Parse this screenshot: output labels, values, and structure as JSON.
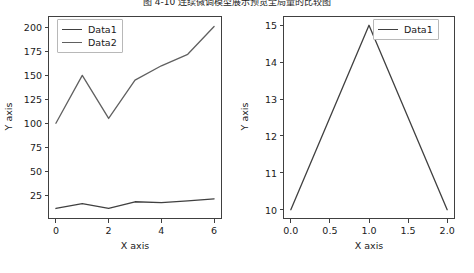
{
  "figure": {
    "title": "图 4-10  连续微调模型展示预览全局量的比较图",
    "background": "#ffffff",
    "line_color": "#404040",
    "frame_color": "#404040"
  },
  "chart_data": [
    {
      "type": "line",
      "id": "left-chart",
      "title": "",
      "xlabel": "X axis",
      "ylabel": "Y axis",
      "xlim": [
        -0.3,
        6.3
      ],
      "ylim": [
        0,
        212
      ],
      "grid": false,
      "legend_position": "upper left",
      "xticks": [
        0,
        2,
        4,
        6
      ],
      "xtick_labels": [
        "0",
        "2",
        "4",
        "6"
      ],
      "yticks": [
        25,
        50,
        75,
        100,
        125,
        150,
        175,
        200
      ],
      "ytick_labels": [
        "25",
        "50",
        "75",
        "100",
        "125",
        "150",
        "175",
        "200"
      ],
      "x": [
        0,
        1,
        2,
        3,
        4,
        5,
        6
      ],
      "series": [
        {
          "name": "Data1",
          "values": [
            11,
            16,
            11,
            18,
            17,
            19,
            21
          ],
          "color": "#404040"
        },
        {
          "name": "Data2",
          "values": [
            100,
            150,
            105,
            145,
            160,
            172,
            201
          ],
          "color": "#606060"
        }
      ]
    },
    {
      "type": "line",
      "id": "right-chart",
      "title": "",
      "xlabel": "X axis",
      "ylabel": "Y axis",
      "xlim": [
        -0.1,
        2.1
      ],
      "ylim": [
        9.75,
        15.25
      ],
      "grid": false,
      "legend_position": "upper right",
      "xticks": [
        0.0,
        0.5,
        1.0,
        1.5,
        2.0
      ],
      "xtick_labels": [
        "0.0",
        "0.5",
        "1.0",
        "1.5",
        "2.0"
      ],
      "yticks": [
        10,
        11,
        12,
        13,
        14,
        15
      ],
      "ytick_labels": [
        "10",
        "11",
        "12",
        "13",
        "14",
        "15"
      ],
      "x": [
        0,
        1,
        2
      ],
      "series": [
        {
          "name": "Data1",
          "values": [
            10,
            15,
            10
          ],
          "color": "#404040"
        }
      ]
    }
  ]
}
